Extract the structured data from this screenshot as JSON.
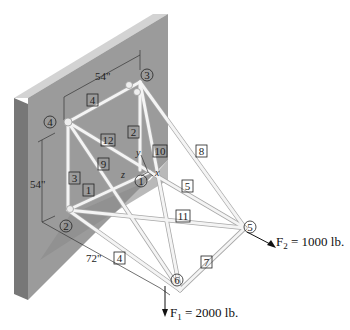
{
  "diagram": {
    "type": "space truss attached to wall",
    "colors": {
      "wall_face": "#9a9a9a",
      "wall_top": "#cfcfcf",
      "wall_side": "#7a7a7a",
      "shadow": "#8c8c8c",
      "member": "#f2f2f2",
      "member_edge": "#b0b0b0"
    },
    "dimensions": {
      "top_width": "54\"",
      "height": "54\"",
      "depth": "72\""
    },
    "nodes": [
      {
        "id": "1",
        "label": "1"
      },
      {
        "id": "2",
        "label": "2"
      },
      {
        "id": "3",
        "label": "3"
      },
      {
        "id": "4",
        "label": "4"
      },
      {
        "id": "5",
        "label": "5"
      },
      {
        "id": "6",
        "label": "6"
      }
    ],
    "members": [
      {
        "label": "1"
      },
      {
        "label": "2"
      },
      {
        "label": "3"
      },
      {
        "label": "4"
      },
      {
        "label": "5"
      },
      {
        "label": "7"
      },
      {
        "label": "8"
      },
      {
        "label": "9"
      },
      {
        "label": "10"
      },
      {
        "label": "11"
      },
      {
        "label": "12"
      }
    ],
    "member_labels": {
      "m1": "1",
      "m2": "2",
      "m3": "3",
      "m4_top": "4",
      "m4_bottom": "4",
      "m5": "5",
      "m7": "7",
      "m8": "8",
      "m9": "9",
      "m10": "10",
      "m11": "11",
      "m12": "12"
    },
    "axes": {
      "x": "x",
      "y": "y",
      "z": "z"
    },
    "forces": {
      "f1": {
        "label": "F",
        "sub": "1",
        "value": " = 2000 lb."
      },
      "f2": {
        "label": "F",
        "sub": "2",
        "value": " = 1000 lb."
      }
    }
  }
}
